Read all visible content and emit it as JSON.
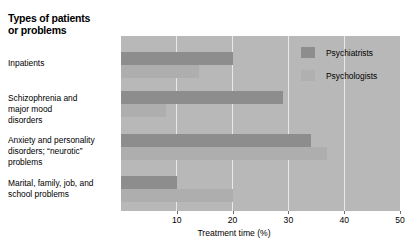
{
  "legend": {
    "position": "top-right-inside",
    "items": [
      {
        "label": "Psychiatrists",
        "color": "#8d8d8d",
        "swatch_name": "legend-swatch-psychiatrists"
      },
      {
        "label": "Psychologists",
        "color": "#b0b0b0",
        "swatch_name": "legend-swatch-psychologists"
      }
    ]
  },
  "axis": {
    "xlabel": "Treatment time (%)",
    "ticks": [
      10,
      20,
      30,
      40,
      50
    ],
    "tick_labels": [
      "10",
      "20",
      "30",
      "40",
      "50"
    ],
    "xmin": 0,
    "xmax": 50
  },
  "categories": [
    "Inpatients",
    "Schizophrenia and\nmajor mood\ndisorders",
    "Anxiety and personality\ndisorders; “neurotic”\nproblems",
    "Marital, family, job, and\nschool problems"
  ],
  "chart_data": {
    "type": "bar",
    "orientation": "horizontal",
    "grouped": true,
    "xlabel": "Treatment time (%)",
    "ylabel": "Types of patients or problems",
    "xlim": [
      0,
      50
    ],
    "grid": true,
    "grid_axis": "x",
    "legend_position": "upper right (inside plot)",
    "categories": [
      "Inpatients",
      "Schizophrenia and major mood disorders",
      "Anxiety and personality disorders; “neurotic” problems",
      "Marital, family, job, and school problems"
    ],
    "series": [
      {
        "name": "Psychiatrists",
        "color": "#8d8d8d",
        "values": [
          20,
          29,
          34,
          10
        ]
      },
      {
        "name": "Psychologists",
        "color": "#aeaeae",
        "values": [
          14,
          8,
          37,
          20
        ]
      }
    ]
  }
}
